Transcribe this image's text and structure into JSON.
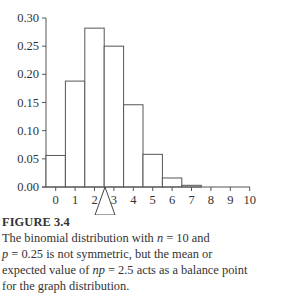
{
  "chart_data": {
    "type": "bar",
    "title": "",
    "xlabel": "",
    "ylabel": "",
    "categories": [
      "0",
      "1",
      "2",
      "3",
      "4",
      "5",
      "6",
      "7",
      "8",
      "9",
      "10"
    ],
    "values": [
      0.056,
      0.188,
      0.282,
      0.25,
      0.146,
      0.058,
      0.016,
      0.003,
      0.0004,
      3e-05,
      1e-06
    ],
    "ylim": [
      0,
      0.3
    ],
    "yticks": [
      "0.00",
      "0.05",
      "0.10",
      "0.15",
      "0.20",
      "0.25",
      "0.30"
    ],
    "xticks": [
      "0",
      "1",
      "2",
      "3",
      "4",
      "5",
      "6",
      "7",
      "8",
      "9",
      "10"
    ],
    "grid": false,
    "legend": null,
    "annotations": [
      {
        "type": "balance-point-triangle",
        "x": 2.5,
        "label": "mean np = 2.5"
      }
    ]
  },
  "caption": {
    "figure_label": "FIGURE 3.4",
    "line1_a": "The binomial distribution with ",
    "line1_var": "n",
    "line1_b": " = 10 and",
    "line2_var": "p",
    "line2_b": " = 0.25 is not symmetric, but the mean or",
    "line3_a": "expected value of ",
    "line3_var": "np",
    "line3_b": " = 2.5 acts as a balance point",
    "line4": "for the graph distribution."
  }
}
